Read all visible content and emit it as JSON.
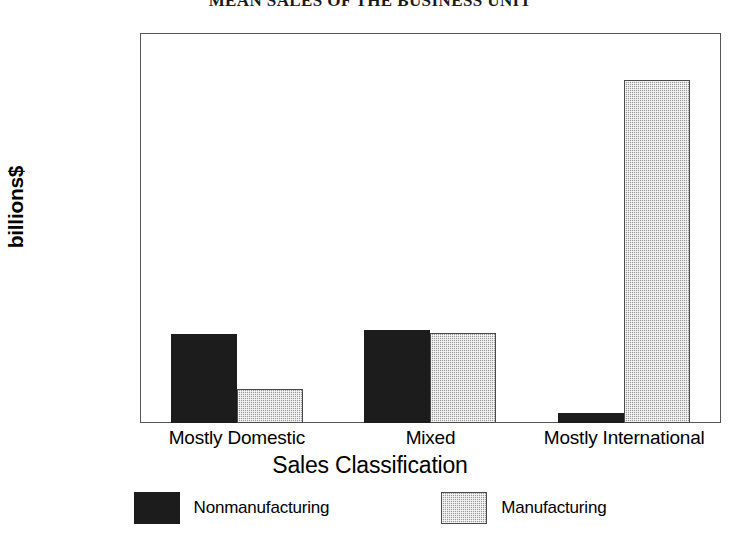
{
  "chart_data": {
    "type": "bar",
    "title": "MEAN SALES OF THE BUSINESS UNIT",
    "xlabel": "Sales Classification",
    "ylabel": "billions$",
    "categories": [
      "Mostly Domestic",
      "Mixed",
      "Mostly International"
    ],
    "series": [
      {
        "name": "Nonmanufacturing",
        "color": "#1c1c1c",
        "values": [
          2750,
          2850,
          300
        ]
      },
      {
        "name": "Manufacturing",
        "color": "#9a9a9a",
        "values": [
          1050,
          2780,
          10550
        ]
      }
    ],
    "ylim": [
      0,
      12000
    ],
    "yticks": [
      0,
      2000,
      4000,
      6000,
      8000,
      10000,
      12000
    ],
    "ytick_labels": [
      "0",
      "2000",
      "4000",
      "6000",
      "8000",
      "10000",
      "12000"
    ],
    "grid": false,
    "legend_position": "bottom"
  }
}
